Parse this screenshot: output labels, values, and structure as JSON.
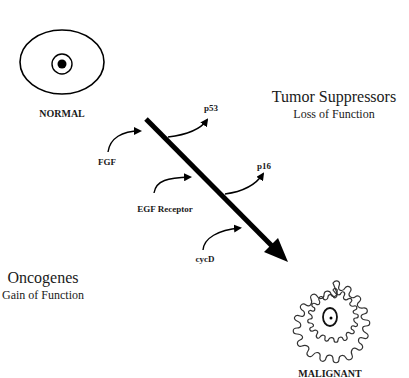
{
  "diagram": {
    "cells": {
      "normal": {
        "label": "NORMAL"
      },
      "malignant": {
        "label": "MALIGNANT"
      }
    },
    "groups": {
      "tumor_suppressors": {
        "title": "Tumor Suppressors",
        "subtitle": "Loss of Function"
      },
      "oncogenes": {
        "title": "Oncogenes",
        "subtitle": "Gain of Function"
      }
    },
    "inputs": [
      {
        "label": "FGF",
        "type": "oncogene"
      },
      {
        "label": "EGF Receptor",
        "type": "oncogene"
      },
      {
        "label": "cycD",
        "type": "oncogene"
      }
    ],
    "outputs": [
      {
        "label": "p53",
        "type": "tumor-suppressor"
      },
      {
        "label": "p16",
        "type": "tumor-suppressor"
      }
    ],
    "main_arrow": {
      "from": "NORMAL",
      "to": "MALIGNANT"
    },
    "colors": {
      "ink": "#000000",
      "background": "#ffffff"
    }
  }
}
